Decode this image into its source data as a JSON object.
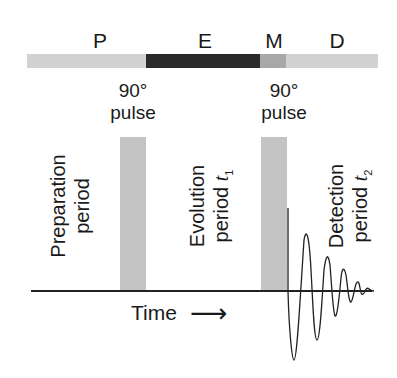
{
  "diagram": {
    "segments": [
      {
        "label": "P",
        "color": "#d2d2d2"
      },
      {
        "label": "E",
        "color": "#2a2a2a"
      },
      {
        "label": "M",
        "color": "#a8a8a8"
      },
      {
        "label": "D",
        "color": "#d2d2d2"
      }
    ],
    "pulses": [
      {
        "angle": "90°",
        "word": "pulse"
      },
      {
        "angle": "90°",
        "word": "pulse"
      }
    ],
    "periods": {
      "preparation": {
        "line1": "Preparation",
        "line2": "period"
      },
      "evolution": {
        "line1": "Evolution",
        "line2": "period",
        "var": "t",
        "sub": "1"
      },
      "detection": {
        "line1": "Detection",
        "line2": "period",
        "var": "t",
        "sub": "2"
      }
    },
    "axis": {
      "label": "Time",
      "arrow": "⟶"
    },
    "colors": {
      "pulse": "#c4c4c4",
      "line": "#222222"
    }
  }
}
